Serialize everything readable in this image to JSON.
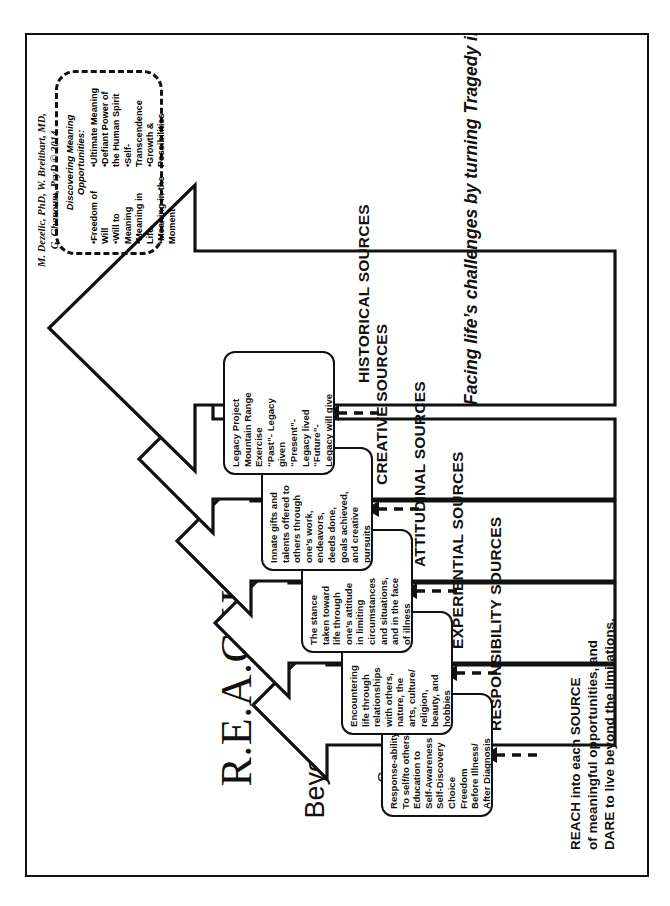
{
  "document": {
    "credit": "M. Dezelic, PhD, W. Breitbart, MD,\nG. Ghanoum, PsyD © 2014",
    "title_main": "R.E.A.C.H.",
    "title_sub": "Beyond the Limitations",
    "title_sub2": "-Sources of Meaning in Life-",
    "tagline": "Facing life’s challenges by turning Tragedy into Triumph!",
    "footer_note": "REACH into each SOURCE\nof meaningful opportunities, and\nDARE to live beyond the limitations."
  },
  "callout": {
    "heading": "Discovering\nMeaning\nOpportunities:",
    "column_1": "•Freedom of Will\n•Will to Meaning\n•Meaning in Life\n•Meaning in the\nMoment",
    "column_2": "•Ultimate Meaning\n•Defiant Power of\nthe Human Spirit\n•Self-Transcendence\n•Growth &\nPossibilities"
  },
  "tiers": [
    {
      "label": "RESPONSIBILITY SOURCES",
      "detail": "Response-ability\nTo self/to others\nEducation to\nSelf-Awareness\nSelf-Discovery\nChoice\nFreedom\nBefore Illness/\nAfter Diagnosis"
    },
    {
      "label": "EXPERIENTIAL SOURCES",
      "detail": "Encountering\nlife through\nrelationships\nwith others,\nnature, the\narts, culture/\nreligion,\nbeauty, and\nhobbies"
    },
    {
      "label": "ATTITUDINAL SOURCES",
      "detail": "The stance\ntaken toward\nlife through\none’s attitude\nin limiting\ncircumstances\nand situations,\nand in the face\nof illness"
    },
    {
      "label": "CREATIVE SOURCES",
      "detail": "Innate gifts and\ntalents offered to\nothers through\none’s work,\nendeavors,\ndeeds done,\ngoals achieved,\nand creative\npursuits"
    },
    {
      "label": "HISTORICAL SOURCES",
      "detail": "Legacy Project\nMountain Range\nExercise\n“Past”- Legacy\ngiven\n“Present”-\nLegacy lived\n“Future”-\nLegacy will give"
    }
  ],
  "colors": {
    "ink": "#111111",
    "paper": "#ffffff"
  }
}
